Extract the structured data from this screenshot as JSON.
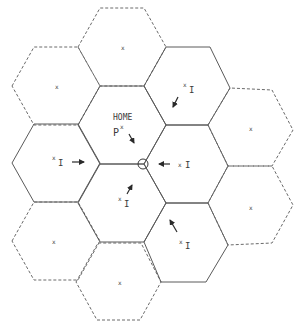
{
  "diagram": {
    "type": "hexagonal cellular grid",
    "colors": {
      "solid_line": "#5a5a5a",
      "dashed_line": "#6a6a6a",
      "text": "#3a3a3a"
    },
    "hex_radius": 44,
    "cells": [
      {
        "id": "c0-0",
        "cx": 56,
        "cy": 86,
        "style": "dashed",
        "label": "x",
        "marker": "x",
        "interferer": false
      },
      {
        "id": "c0-1",
        "cx": 56,
        "cy": 163,
        "style": "solid",
        "label": "xI",
        "marker": "x",
        "interferer": true,
        "arrow": "right"
      },
      {
        "id": "c0-2",
        "cx": 56,
        "cy": 241,
        "style": "dashed",
        "label": "x",
        "marker": "x",
        "interferer": false
      },
      {
        "id": "c1-0",
        "cx": 122,
        "cy": 47,
        "style": "dashed",
        "label": "x",
        "marker": "x",
        "interferer": false
      },
      {
        "id": "c1-1",
        "cx": 122,
        "cy": 125,
        "style": "solid",
        "label": "HOME",
        "marker": "P",
        "interferer": false,
        "home": true,
        "arrow": "down-right"
      },
      {
        "id": "c1-2",
        "cx": 122,
        "cy": 203,
        "style": "solid",
        "label": "xI",
        "marker": "x",
        "interferer": true,
        "arrow": "up-right"
      },
      {
        "id": "c1-3",
        "cx": 119,
        "cy": 282,
        "style": "dashed",
        "label": "x",
        "marker": "x",
        "interferer": false
      },
      {
        "id": "c2-0",
        "cx": 188,
        "cy": 86,
        "style": "solid",
        "label": "xI",
        "marker": "x",
        "interferer": true,
        "arrow": "down-left"
      },
      {
        "id": "c2-1",
        "cx": 188,
        "cy": 163,
        "style": "solid",
        "label": "xI",
        "marker": "x",
        "interferer": true,
        "arrow": "left"
      },
      {
        "id": "c2-2",
        "cx": 188,
        "cy": 243,
        "style": "solid",
        "label": "xI",
        "marker": "x",
        "interferer": true,
        "arrow": "up-left"
      },
      {
        "id": "c3-0",
        "cx": 251,
        "cy": 127,
        "style": "dashed",
        "label": "x",
        "marker": "x",
        "interferer": false
      },
      {
        "id": "c3-1",
        "cx": 251,
        "cy": 205,
        "style": "dashed",
        "label": "x",
        "marker": "x",
        "interferer": false
      }
    ],
    "labels": {
      "home": "HOME",
      "p": "P",
      "x": "x",
      "I": "I"
    },
    "reference_point": {
      "cx": 143,
      "cy": 164,
      "r": 5,
      "shape": "circle"
    }
  }
}
